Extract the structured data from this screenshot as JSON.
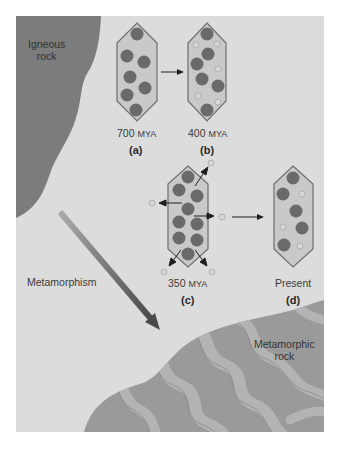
{
  "figure": {
    "background_color": "#dcdcdc",
    "igneous_rock": {
      "label_line1": "Igneous",
      "label_line2": "rock",
      "color": "#7c7c7c"
    },
    "metamorphic_rock": {
      "label_line1": "Metamorphic",
      "label_line2": "rock",
      "color": "#9a9a9a",
      "band_color": "#b0b0b0"
    },
    "process": {
      "label": "Metamorphism",
      "arrow_start_color": "#a9a9a9",
      "arrow_end_color": "#4a4a4a"
    },
    "panels": [
      {
        "id": "a",
        "letter": "(a)",
        "age_value": "700",
        "age_unit": "MYA",
        "description": "Crystal with all parent atoms"
      },
      {
        "id": "b",
        "letter": "(b)",
        "age_value": "400",
        "age_unit": "MYA",
        "description": "Some parent atoms decayed to daughter atoms"
      },
      {
        "id": "c",
        "letter": "(c)",
        "age_value": "350",
        "age_unit": "MYA",
        "description": "Daughter atoms expelled during metamorphism"
      },
      {
        "id": "d",
        "letter": "(d)",
        "age_value": "Present",
        "age_unit": "",
        "description": "Crystal resets clock, new daughter atoms accumulate"
      }
    ],
    "colors": {
      "crystal_fill": "#c9c9c9",
      "crystal_stroke": "#6e6e6e",
      "parent_atom": "#6a6a6a",
      "daughter_atom_fill": "#d6d6d6",
      "daughter_atom_stroke": "#a8a8a8",
      "arrow": "#1e1e1e"
    }
  }
}
